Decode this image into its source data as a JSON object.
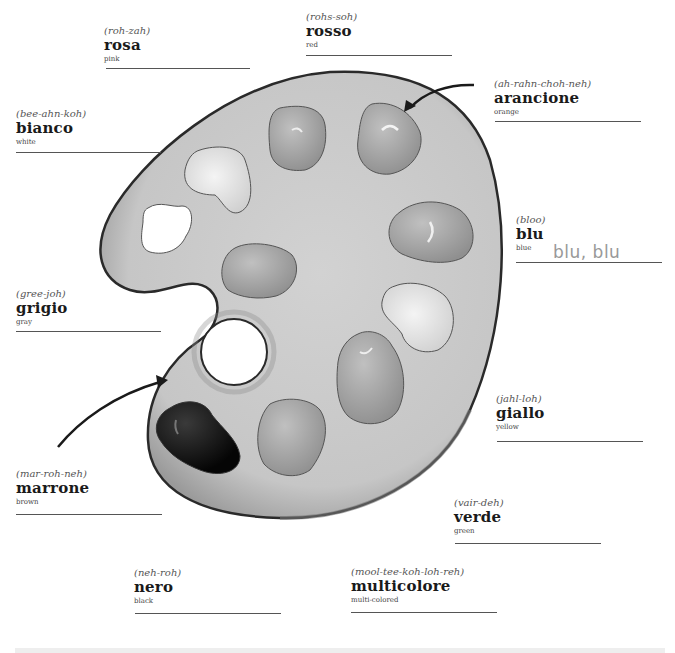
{
  "worksheet": {
    "subject": "Italian color words",
    "illustration": "artist-palette",
    "colors": [
      {
        "id": "rosa",
        "pronunciation": "(roh-zah)",
        "word": "rosa",
        "english": "pink"
      },
      {
        "id": "rosso",
        "pronunciation": "(rohs-soh)",
        "word": "rosso",
        "english": "red"
      },
      {
        "id": "arancione",
        "pronunciation": "(ah-rahn-choh-neh)",
        "word": "arancione",
        "english": "orange"
      },
      {
        "id": "bianco",
        "pronunciation": "(bee-ahn-koh)",
        "word": "bianco",
        "english": "white"
      },
      {
        "id": "blu",
        "pronunciation": "(bloo)",
        "word": "blu",
        "english": "blue"
      },
      {
        "id": "grigio",
        "pronunciation": "(gree-joh)",
        "word": "grigio",
        "english": "gray"
      },
      {
        "id": "giallo",
        "pronunciation": "(jahl-loh)",
        "word": "giallo",
        "english": "yellow"
      },
      {
        "id": "marrone",
        "pronunciation": "(mar-roh-neh)",
        "word": "marrone",
        "english": "brown"
      },
      {
        "id": "verde",
        "pronunciation": "(vair-deh)",
        "word": "verde",
        "english": "green"
      },
      {
        "id": "nero",
        "pronunciation": "(neh-roh)",
        "word": "nero",
        "english": "black"
      },
      {
        "id": "multicolore",
        "pronunciation": "(mool-tee-koh-loh-reh)",
        "word": "multicolore",
        "english": "multi-colored"
      }
    ],
    "answers": {
      "blu": "blu, blu"
    }
  },
  "palette_colors": {
    "board": "#c9c9c9",
    "board_shadow": "#8a8a8a",
    "outline": "#2a2a2a",
    "blob_mid": "#a8a8a8",
    "blob_light": "#d6d6d6",
    "blob_white": "#ffffff",
    "blob_black": "#141414"
  }
}
